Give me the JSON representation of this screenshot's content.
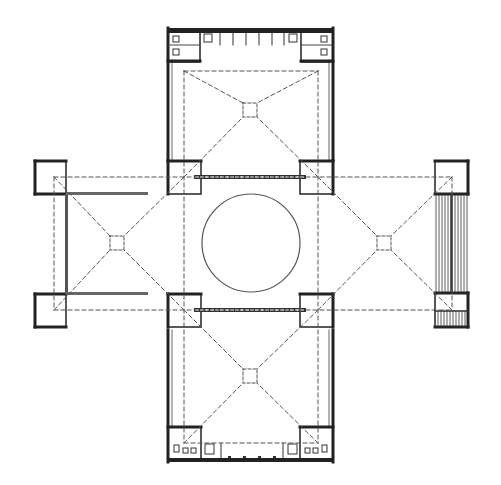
{
  "diagram": {
    "type": "architectural-floor-plan",
    "colors": {
      "background": "#ffffff",
      "wall": "#222222",
      "dash": "#555555",
      "thin": "#666666"
    },
    "central_circle": {
      "cx": 251,
      "cy": 243,
      "r": 49
    },
    "arms": [
      "north",
      "south",
      "west",
      "east"
    ],
    "bosses": [
      {
        "name": "north-boss",
        "x": 243,
        "y": 103,
        "size": 14
      },
      {
        "name": "south-boss",
        "x": 243,
        "y": 369,
        "size": 14
      },
      {
        "name": "west-boss",
        "x": 110,
        "y": 236,
        "size": 14
      },
      {
        "name": "east-boss",
        "x": 377,
        "y": 236,
        "size": 14
      }
    ]
  }
}
